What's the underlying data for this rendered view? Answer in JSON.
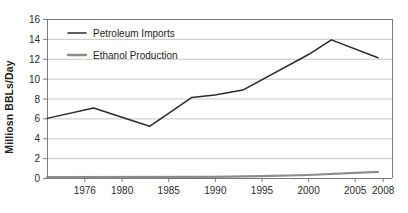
{
  "chart_data": {
    "type": "line",
    "title": "",
    "xlabel": "",
    "ylabel": "Milliosn BBLs/Day",
    "xlim": [
      1972,
      2009
    ],
    "ylim": [
      0,
      16
    ],
    "ytick_step": 2,
    "yticks": [
      "0",
      "2",
      "4",
      "6",
      "8",
      "10",
      "12",
      "14",
      "16"
    ],
    "xticks": [
      "1976",
      "1980",
      "1985",
      "1990",
      "1995",
      "2000",
      "2005",
      "2008"
    ],
    "xtick_values": [
      1976,
      1980,
      1985,
      1990,
      1995,
      2000,
      2005,
      2008
    ],
    "grid": true,
    "grid_axis": "y",
    "legend_position": "top-left",
    "series": [
      {
        "name": "Petroleum Imports",
        "color": "#2b2b2b",
        "x": [
          1972,
          1977,
          1983,
          1987.5,
          1990,
          1993,
          2000,
          2002.5,
          2007.5
        ],
        "values": [
          6.0,
          7.05,
          5.2,
          8.1,
          8.35,
          8.85,
          12.4,
          13.9,
          12.1
        ]
      },
      {
        "name": "Ethanol Production",
        "color": "#8c8c8c",
        "x": [
          1972,
          1990,
          1995,
          2000,
          2007.5
        ],
        "values": [
          0.08,
          0.12,
          0.18,
          0.3,
          0.62
        ]
      }
    ]
  },
  "legend": {
    "items": [
      {
        "label": "Petroleum Imports",
        "color": "#2b2b2b"
      },
      {
        "label": "Ethanol Production",
        "color": "#8c8c8c"
      }
    ]
  },
  "colors": {
    "petroleum": "#2b2b2b",
    "ethanol": "#8c8c8c",
    "grid": "#b9b9b9",
    "axis": "#6f6f6f",
    "background": "#ffffff"
  }
}
